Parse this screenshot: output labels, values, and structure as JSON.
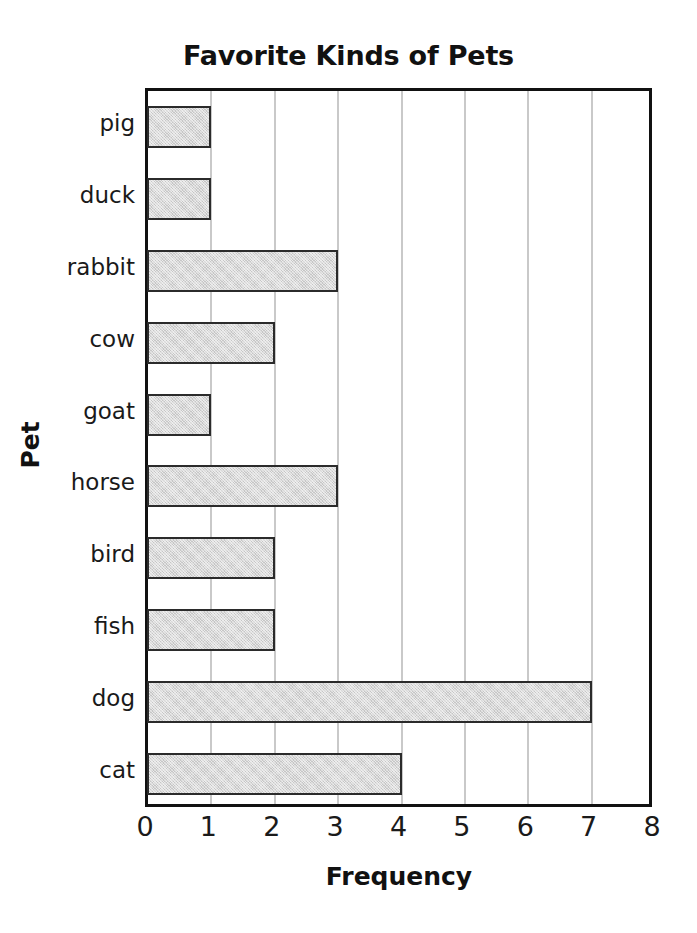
{
  "chart_data": {
    "type": "bar",
    "orientation": "horizontal",
    "title": "Favorite Kinds of Pets",
    "xlabel": "Frequency",
    "ylabel": "Pet",
    "categories": [
      "pig",
      "duck",
      "rabbit",
      "cow",
      "goat",
      "horse",
      "bird",
      "fish",
      "dog",
      "cat"
    ],
    "values": [
      1,
      1,
      3,
      2,
      1,
      3,
      2,
      2,
      7,
      4
    ],
    "xlim": [
      0,
      8
    ],
    "xticks": [
      0,
      1,
      2,
      3,
      4,
      5,
      6,
      7,
      8
    ],
    "xtick_labels": [
      "0",
      "1",
      "2",
      "3",
      "4",
      "5",
      "6",
      "7",
      "8"
    ],
    "grid": "vertical",
    "legend": "none",
    "bar_fill_color": "#d9d9d9",
    "bar_edge_color": "#2b2b2b",
    "gridline_color": "#c9c9c9",
    "axis_color": "#111111"
  }
}
